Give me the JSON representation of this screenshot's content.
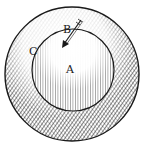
{
  "diagram": {
    "labels": {
      "a": "A",
      "b": "B",
      "c": "C"
    },
    "colors": {
      "ink": "#1a1a1a",
      "paper": "#ffffff"
    }
  }
}
